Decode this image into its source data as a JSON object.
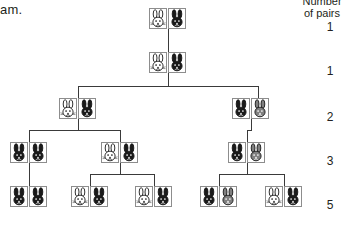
{
  "page": {
    "left_cut_text": "am.",
    "background": "#ffffff",
    "line_color": "#3a3a3a",
    "box_border_color": "#8d8d8d"
  },
  "column_header": {
    "line1": "Number",
    "line2": "of pairs"
  },
  "counts": [
    "1",
    "1",
    "2",
    "3",
    "5"
  ],
  "rabbit_colors": {
    "white": "#ffffff",
    "black": "#1a1a1a",
    "gray": "#808080",
    "outline": "#1a1a1a"
  },
  "chart_data": {
    "type": "diagram",
    "generations": [
      {
        "generation": 1,
        "pairs_label": "1",
        "pairs": [
          {
            "rabbits": [
              "white",
              "black"
            ]
          }
        ]
      },
      {
        "generation": 2,
        "pairs_label": "1",
        "pairs": [
          {
            "rabbits": [
              "white",
              "black"
            ]
          }
        ]
      },
      {
        "generation": 3,
        "pairs_label": "2",
        "pairs": [
          {
            "rabbits": [
              "white",
              "black"
            ]
          },
          {
            "rabbits": [
              "black",
              "gray"
            ]
          }
        ]
      },
      {
        "generation": 4,
        "pairs_label": "3",
        "pairs": [
          {
            "rabbits": [
              "black",
              "black"
            ]
          },
          {
            "rabbits": [
              "white",
              "black"
            ]
          },
          {
            "rabbits": [
              "black",
              "gray"
            ]
          }
        ]
      },
      {
        "generation": 5,
        "pairs_label": "5",
        "pairs": [
          {
            "rabbits": [
              "black",
              "black"
            ]
          },
          {
            "rabbits": [
              "white",
              "black"
            ]
          },
          {
            "rabbits": [
              "white",
              "black"
            ]
          },
          {
            "rabbits": [
              "black",
              "gray"
            ]
          },
          {
            "rabbits": [
              "white",
              "black"
            ]
          }
        ]
      }
    ],
    "sequence": [
      1,
      1,
      2,
      3,
      5
    ],
    "ylabel": "Number of pairs"
  },
  "layout": {
    "pair_positions": [
      [
        {
          "x": 149,
          "y": 8
        }
      ],
      [
        {
          "x": 149,
          "y": 52
        }
      ],
      [
        {
          "x": 59,
          "y": 98
        },
        {
          "x": 232,
          "y": 98
        }
      ],
      [
        {
          "x": 10,
          "y": 142
        },
        {
          "x": 101,
          "y": 142
        },
        {
          "x": 228,
          "y": 142
        }
      ],
      [
        {
          "x": 10,
          "y": 186
        },
        {
          "x": 71,
          "y": 186
        },
        {
          "x": 135,
          "y": 186
        },
        {
          "x": 200,
          "y": 186
        },
        {
          "x": 265,
          "y": 186
        }
      ]
    ],
    "count_label_positions": [
      {
        "x": 322,
        "y": 20
      },
      {
        "x": 322,
        "y": 64
      },
      {
        "x": 322,
        "y": 110
      },
      {
        "x": 322,
        "y": 154
      },
      {
        "x": 322,
        "y": 198
      }
    ],
    "connectors": [
      {
        "type": "v",
        "x": 168,
        "y": 29,
        "len": 23,
        "name": "gen1-to-gen2-stem"
      },
      {
        "type": "v",
        "x": 168,
        "y": 73,
        "len": 13,
        "name": "gen2-stem-down"
      },
      {
        "type": "h",
        "x": 78,
        "y": 86,
        "len": 180,
        "name": "gen2-to-gen3-bar"
      },
      {
        "type": "v",
        "x": 78,
        "y": 86,
        "len": 12,
        "name": "gen3-left-drop"
      },
      {
        "type": "v",
        "x": 258,
        "y": 86,
        "len": 12,
        "name": "gen3-right-drop"
      },
      {
        "type": "v",
        "x": 78,
        "y": 119,
        "len": 11,
        "name": "gen3-left-stem-down"
      },
      {
        "type": "h",
        "x": 29,
        "y": 130,
        "len": 91,
        "name": "gen3-left-to-gen4-bar"
      },
      {
        "type": "v",
        "x": 29,
        "y": 130,
        "len": 12,
        "name": "gen4-p1-drop"
      },
      {
        "type": "v",
        "x": 120,
        "y": 130,
        "len": 12,
        "name": "gen4-p2-drop"
      },
      {
        "type": "v",
        "x": 251,
        "y": 119,
        "len": 11,
        "name": "gen3-right-stem-down"
      },
      {
        "type": "h",
        "x": 247,
        "y": 130,
        "len": 5,
        "name": "gen3-right-to-gen4-bar"
      },
      {
        "type": "v",
        "x": 247,
        "y": 130,
        "len": 12,
        "name": "gen4-p3-drop"
      },
      {
        "type": "v",
        "x": 29,
        "y": 163,
        "len": 11,
        "name": "gen4-p1-stem-down"
      },
      {
        "type": "h",
        "x": 29,
        "y": 174,
        "len": 1,
        "name": "gen4-p1-to-gen5-bar"
      },
      {
        "type": "v",
        "x": 29,
        "y": 174,
        "len": 12,
        "name": "gen5-p1-drop"
      },
      {
        "type": "v",
        "x": 120,
        "y": 163,
        "len": 11,
        "name": "gen4-p2-stem-down"
      },
      {
        "type": "h",
        "x": 90,
        "y": 174,
        "len": 64,
        "name": "gen4-p2-to-gen5-bar"
      },
      {
        "type": "v",
        "x": 90,
        "y": 174,
        "len": 12,
        "name": "gen5-p2-drop"
      },
      {
        "type": "v",
        "x": 154,
        "y": 174,
        "len": 12,
        "name": "gen5-p3-drop"
      },
      {
        "type": "v",
        "x": 247,
        "y": 163,
        "len": 11,
        "name": "gen4-p3-stem-down"
      },
      {
        "type": "h",
        "x": 219,
        "y": 174,
        "len": 65,
        "name": "gen4-p3-to-gen5-bar"
      },
      {
        "type": "v",
        "x": 219,
        "y": 174,
        "len": 12,
        "name": "gen5-p4-drop"
      },
      {
        "type": "v",
        "x": 284,
        "y": 174,
        "len": 12,
        "name": "gen5-p5-drop"
      }
    ]
  }
}
